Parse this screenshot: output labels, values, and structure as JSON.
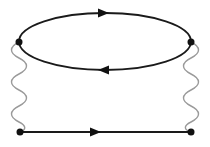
{
  "diagram": {
    "type": "feynman-diagram",
    "colors": {
      "fermion_line": "#1a1a1a",
      "photon_line": "#9a9a9a",
      "vertex": "#111111",
      "background": "#ffffff"
    },
    "vertices": [
      {
        "id": "top-left",
        "x": 19,
        "y": 42
      },
      {
        "id": "top-right",
        "x": 191,
        "y": 42
      },
      {
        "id": "bottom-left",
        "x": 20,
        "y": 132
      },
      {
        "id": "bottom-right",
        "x": 191,
        "y": 132
      }
    ],
    "fermion_loop": {
      "cx": 105,
      "cy": 41.5,
      "rx": 86,
      "ry": 28.5,
      "upper_arrow": {
        "x": 103,
        "y": 13,
        "direction": "right"
      },
      "lower_arrow": {
        "x": 104,
        "y": 70,
        "direction": "left"
      }
    },
    "photon_lines": [
      {
        "from": "top-left",
        "to": "bottom-left",
        "oscillations": 4
      },
      {
        "from": "top-right",
        "to": "bottom-right",
        "oscillations": 4
      }
    ],
    "fermion_line": {
      "from": "bottom-left",
      "to": "bottom-right",
      "arrow": {
        "x": 95,
        "y": 132,
        "direction": "right"
      }
    }
  }
}
